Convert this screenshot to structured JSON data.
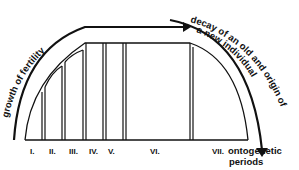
{
  "diagram": {
    "title": "",
    "curved_labels": {
      "growth": "growth of fertility",
      "decay_line1": "decay of an old and origin of",
      "decay_line2": "a new individual"
    },
    "periods": [
      {
        "label": "I.",
        "x0": 25,
        "x1": 42
      },
      {
        "label": "II.",
        "x0": 45,
        "x1": 62
      },
      {
        "label": "III.",
        "x0": 65,
        "x1": 83
      },
      {
        "label": "IV.",
        "x0": 86,
        "x1": 103
      },
      {
        "label": "V.",
        "x0": 106,
        "x1": 123
      },
      {
        "label": "VI.",
        "x0": 126,
        "x1": 190
      },
      {
        "label": "VII.",
        "x0": 193,
        "x1": 248
      }
    ],
    "axis_label_line1": "ontogenetic",
    "axis_label_line2": "periods",
    "colors": {
      "ink": "#111111",
      "background": "#ffffff"
    }
  }
}
